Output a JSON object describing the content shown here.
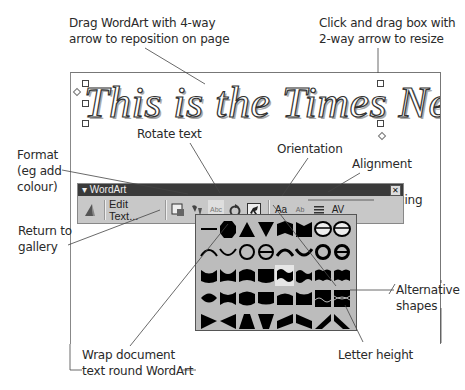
{
  "annotations": {
    "drag_wordart": [
      "Drag WordArt with 4-way",
      "arrow to reposition on page"
    ],
    "resize": [
      "Click and drag box with",
      "2-way arrow to resize"
    ],
    "rotate": "Rotate text",
    "format": [
      "Format",
      "(eg add",
      "colour)"
    ],
    "orientation": "Orientation",
    "alignment": "Alignment",
    "spacing": "Spacing",
    "return_gallery": [
      "Return to",
      "gallery"
    ],
    "alternative_shapes": [
      "Alternative",
      "shapes"
    ],
    "letter_height": "Letter height",
    "wrap": [
      "Wrap document",
      "text round WordArt"
    ]
  },
  "wordart": {
    "text": "This is the Times New Roman"
  },
  "toolbar": {
    "title": "WordArt",
    "title_arrow": "▾",
    "close": "✕",
    "buttons": [
      {
        "name": "insert-wordart",
        "icon": "wordart-a-icon"
      },
      {
        "name": "edit-text",
        "label": "Edit Text..."
      },
      {
        "name": "wordart-gallery",
        "icon": "gallery-icon"
      },
      {
        "name": "format-wordart",
        "icon": "paint-format-icon"
      },
      {
        "name": "wordart-shape",
        "icon": "abc-shape-icon",
        "label": "Abc"
      },
      {
        "name": "free-rotate",
        "icon": "rotate-icon"
      },
      {
        "name": "text-wrapping",
        "icon": "wrap-dog-icon"
      },
      {
        "name": "same-letter-heights",
        "label": "Aa"
      },
      {
        "name": "vertical-text",
        "label": "Ab"
      },
      {
        "name": "alignment",
        "icon": "align-icon"
      },
      {
        "name": "character-spacing",
        "label": "AV"
      }
    ]
  },
  "gallery": {
    "rows": 5,
    "columns": 8,
    "selected_index": 20
  }
}
